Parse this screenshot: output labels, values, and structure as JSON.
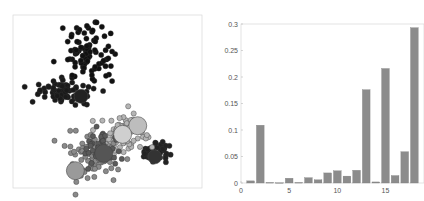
{
  "chart_data": [
    {
      "type": "scatter",
      "title": "",
      "xlabel": "",
      "ylabel": "",
      "grid": false,
      "legend": null,
      "description": "Unlabeled 2D scatter plot showing clustered points: two dense dark clusters in the upper half and a mixed-gray cluster with large centroid markers in the lower half, plus a dark cluster to the lower right.",
      "clusters": [
        {
          "name": "upper-dark",
          "color": "#111111",
          "center": [
            0.42,
            0.22
          ],
          "spread": [
            0.07,
            0.08
          ],
          "n": 90
        },
        {
          "name": "middle-dark",
          "color": "#1a1a1a",
          "center": [
            0.28,
            0.45
          ],
          "spread": [
            0.08,
            0.03
          ],
          "n": 70
        },
        {
          "name": "lower-right-dark",
          "color": "#222222",
          "center": [
            0.77,
            0.78
          ],
          "spread": [
            0.04,
            0.03
          ],
          "n": 45
        },
        {
          "name": "lower-gray-light",
          "color": "#b5b5b5",
          "center": [
            0.57,
            0.7
          ],
          "spread": [
            0.08,
            0.06
          ],
          "n": 70
        },
        {
          "name": "lower-gray-mid",
          "color": "#8a8a8a",
          "center": [
            0.42,
            0.82
          ],
          "spread": [
            0.08,
            0.07
          ],
          "n": 70
        },
        {
          "name": "lower-gray-dark",
          "color": "#5a5a5a",
          "center": [
            0.47,
            0.77
          ],
          "spread": [
            0.05,
            0.05
          ],
          "n": 40
        }
      ],
      "centroids": [
        {
          "x": 0.66,
          "y": 0.64,
          "r": 9,
          "color": "#bdbdbd"
        },
        {
          "x": 0.58,
          "y": 0.69,
          "r": 9,
          "color": "#cfcfcf"
        },
        {
          "x": 0.48,
          "y": 0.8,
          "r": 9,
          "color": "#555555"
        },
        {
          "x": 0.33,
          "y": 0.9,
          "r": 9,
          "color": "#9a9a9a"
        },
        {
          "x": 0.75,
          "y": 0.82,
          "r": 7,
          "color": "#333333"
        },
        {
          "x": 0.36,
          "y": 0.47,
          "r": 7,
          "color": "#222222"
        }
      ]
    },
    {
      "type": "bar",
      "title": "",
      "xlabel": "",
      "ylabel": "",
      "categories": [
        1,
        2,
        3,
        4,
        5,
        6,
        7,
        8,
        9,
        10,
        11,
        12,
        13,
        14,
        15,
        16,
        17,
        18
      ],
      "values": [
        0.004,
        0.109,
        0.001,
        0.0005,
        0.009,
        0.001,
        0.01,
        0.006,
        0.019,
        0.023,
        0.013,
        0.024,
        0.176,
        0.002,
        0.216,
        0.014,
        0.059,
        0.293
      ],
      "xticks": [
        0,
        5,
        10,
        15
      ],
      "yticks": [
        0,
        0.05,
        0.1,
        0.15,
        0.2,
        0.25,
        0.3
      ],
      "ytick_labels": [
        "0",
        "0.05",
        "0.1",
        "0.15",
        "0.2",
        "0.25",
        "0.3"
      ],
      "xlim": [
        0,
        19
      ],
      "ylim": [
        0,
        0.3
      ],
      "bar_color": "#8c8c8c",
      "grid": false,
      "legend": null
    }
  ]
}
